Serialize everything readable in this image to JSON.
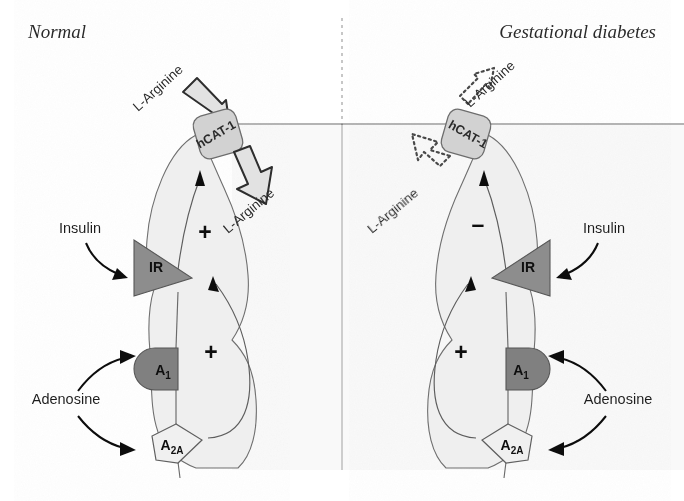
{
  "figure": {
    "type": "biological-pathway-diagram"
  },
  "panels": [
    {
      "id": "normal",
      "title": "Normal",
      "title_x": 28,
      "title_y": 38,
      "transporter": {
        "label": "hCAT-1",
        "state": "active"
      },
      "extracellular_ligand": "L-Arginine",
      "intracellular_ligand": "L-Arginine",
      "transport_effect_sign": "+",
      "adenosine_effect_sign": "+",
      "receptors": [
        {
          "name": "IR",
          "full": "insulin-receptor",
          "ligand": "Insulin",
          "shade": "dark"
        },
        {
          "name": "A",
          "sub": "1",
          "full": "adenosine-A1-receptor",
          "ligand": "Adenosine",
          "shade": "dark"
        },
        {
          "name": "A",
          "sub": "2A",
          "full": "adenosine-A2A-receptor",
          "ligand": "Adenosine",
          "shade": "light"
        }
      ],
      "ligand_labels": {
        "insulin": "Insulin",
        "adenosine": "Adenosine"
      }
    },
    {
      "id": "gestational-diabetes",
      "title": "Gestational diabetes",
      "title_x": 656,
      "title_y": 38,
      "transporter": {
        "label": "hCAT-1",
        "state": "reduced"
      },
      "extracellular_ligand": "L-Arginine",
      "intracellular_ligand": "L-Arginine",
      "transport_effect_sign": "–",
      "adenosine_effect_sign": "+",
      "receptors": [
        {
          "name": "IR",
          "full": "insulin-receptor",
          "ligand": "Insulin",
          "shade": "dark"
        },
        {
          "name": "A",
          "sub": "1",
          "full": "adenosine-A1-receptor",
          "ligand": "Adenosine",
          "shade": "dark"
        },
        {
          "name": "A",
          "sub": "2A",
          "full": "adenosine-A2A-receptor",
          "ligand": "Adenosine",
          "shade": "light"
        }
      ],
      "ligand_labels": {
        "insulin": "Insulin",
        "adenosine": "Adenosine"
      }
    }
  ],
  "colors": {
    "cell_fill": "#efefef",
    "cell_stroke": "#6f6f6f",
    "transporter_fill": "#d2d2d2",
    "ir_fill": "#8d8d8d",
    "a1_fill": "#808080",
    "a2a_fill": "#f0f0f0",
    "arrow_black": "#111111",
    "divider": "#9a9a9a",
    "background": "#ffffff"
  },
  "divider": {
    "style_top": "dashed",
    "style_bottom": "solid",
    "x": 342
  }
}
